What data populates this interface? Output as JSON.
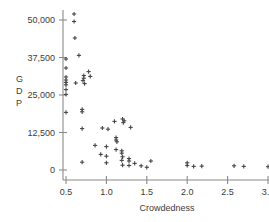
{
  "chart_data": {
    "type": "scatter",
    "title": "",
    "subtitle": "",
    "xlabel": "Crowdedness",
    "ylabel": "GDP",
    "ylabel_stacked": [
      "G",
      "D",
      "P"
    ],
    "xlim": [
      0.42,
      3.06
    ],
    "ylim": [
      -1800,
      53500
    ],
    "xticks": [
      0.5,
      1.0,
      1.5,
      2.0,
      2.5,
      3.0
    ],
    "xtick_labels": [
      "0.5",
      "1.0",
      "1.5",
      "2.0",
      "2.5",
      "3.0"
    ],
    "yticks": [
      0,
      12500,
      25000,
      37500,
      50000
    ],
    "ytick_labels": [
      "0",
      "12,500",
      "25,000",
      "37,500",
      "50,000"
    ],
    "grid": false,
    "legend": null,
    "marker": "plus",
    "marker_color": "#464646",
    "axis_color": "#8a8a8a",
    "background": "#ffffff",
    "points": [
      {
        "x": 0.6,
        "y": 52000
      },
      {
        "x": 0.6,
        "y": 49500
      },
      {
        "x": 0.61,
        "y": 44000
      },
      {
        "x": 0.66,
        "y": 38200
      },
      {
        "x": 0.5,
        "y": 37000
      },
      {
        "x": 0.5,
        "y": 34000
      },
      {
        "x": 0.78,
        "y": 32800
      },
      {
        "x": 0.72,
        "y": 31500
      },
      {
        "x": 0.8,
        "y": 31200
      },
      {
        "x": 0.5,
        "y": 31000
      },
      {
        "x": 0.72,
        "y": 30600
      },
      {
        "x": 0.5,
        "y": 30000
      },
      {
        "x": 0.71,
        "y": 29800
      },
      {
        "x": 0.5,
        "y": 29200
      },
      {
        "x": 0.62,
        "y": 29000
      },
      {
        "x": 0.73,
        "y": 28800
      },
      {
        "x": 0.5,
        "y": 28400
      },
      {
        "x": 0.5,
        "y": 26800
      },
      {
        "x": 0.5,
        "y": 25200
      },
      {
        "x": 0.7,
        "y": 20200
      },
      {
        "x": 0.7,
        "y": 19400
      },
      {
        "x": 0.5,
        "y": 19200
      },
      {
        "x": 1.2,
        "y": 17000
      },
      {
        "x": 1.22,
        "y": 16400
      },
      {
        "x": 1.1,
        "y": 16200
      },
      {
        "x": 1.21,
        "y": 15800
      },
      {
        "x": 1.3,
        "y": 14200
      },
      {
        "x": 0.95,
        "y": 14000
      },
      {
        "x": 0.7,
        "y": 13800
      },
      {
        "x": 1.02,
        "y": 13600
      },
      {
        "x": 1.12,
        "y": 10800
      },
      {
        "x": 1.12,
        "y": 10000
      },
      {
        "x": 1.13,
        "y": 9400
      },
      {
        "x": 0.86,
        "y": 8200
      },
      {
        "x": 1.0,
        "y": 7800
      },
      {
        "x": 1.12,
        "y": 6800
      },
      {
        "x": 1.19,
        "y": 6400
      },
      {
        "x": 1.19,
        "y": 5600
      },
      {
        "x": 0.93,
        "y": 5200
      },
      {
        "x": 1.0,
        "y": 4600
      },
      {
        "x": 1.2,
        "y": 4400
      },
      {
        "x": 1.28,
        "y": 3800
      },
      {
        "x": 1.19,
        "y": 3200
      },
      {
        "x": 1.28,
        "y": 3000
      },
      {
        "x": 1.55,
        "y": 3000
      },
      {
        "x": 0.7,
        "y": 2600
      },
      {
        "x": 1.0,
        "y": 2400
      },
      {
        "x": 1.35,
        "y": 2200
      },
      {
        "x": 1.2,
        "y": 1600
      },
      {
        "x": 1.28,
        "y": 1500
      },
      {
        "x": 1.43,
        "y": 1400
      },
      {
        "x": 1.5,
        "y": 900
      },
      {
        "x": 2.0,
        "y": 2400
      },
      {
        "x": 2.0,
        "y": 1500
      },
      {
        "x": 2.08,
        "y": 1200
      },
      {
        "x": 2.18,
        "y": 1300
      },
      {
        "x": 2.58,
        "y": 1400
      },
      {
        "x": 2.7,
        "y": 1200
      },
      {
        "x": 3.0,
        "y": 1100
      }
    ]
  }
}
